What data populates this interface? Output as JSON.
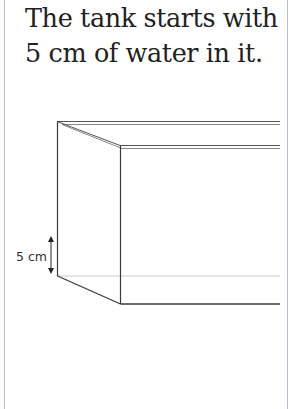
{
  "caption": {
    "line1": "The tank starts with",
    "line2": "5 cm of water in it."
  },
  "diagram": {
    "subject": "tank",
    "water_depth_label": "5 cm",
    "icons": [
      "double-headed-arrow-icon"
    ],
    "colors": {
      "outline": "#3a3a3a",
      "water_line": "#c8ccd6",
      "frame_border": "#b9bfd4"
    }
  }
}
